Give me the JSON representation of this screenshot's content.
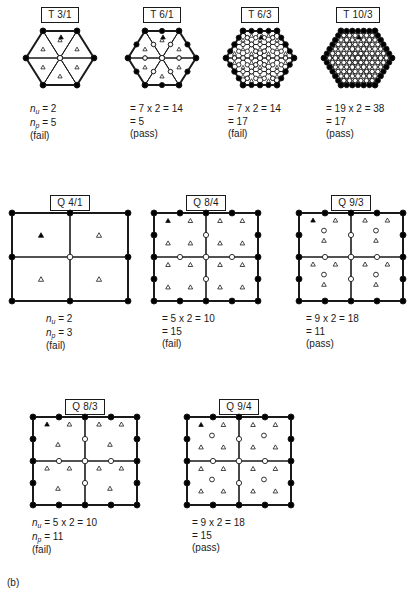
{
  "figure": {
    "panel_tag": "(b)",
    "background": "#ffffff",
    "ink": "#1a1a1a",
    "node_fill_boundary": "#000000",
    "node_fill_interior": "#ffffff",
    "marker_unknown_filled": "#000000",
    "marker_unknown_open": "#ffffff"
  },
  "patches": [
    {
      "id": "t31",
      "label": "T 3/1",
      "kind": "triangle-hex",
      "x": 6,
      "y": 4,
      "w": 108,
      "mesh_w": 108,
      "mesh_h": 78,
      "divisions": 1,
      "caption_lines": [
        {
          "prefix": "n",
          "sub": "u",
          "text": " = 2"
        },
        {
          "prefix": "n",
          "sub": "p",
          "text": " = 5"
        },
        {
          "text": "(fail)"
        }
      ],
      "caption_x": 24,
      "result": "fail"
    },
    {
      "id": "t61",
      "label": "T 6/1",
      "kind": "triangle-hex",
      "x": 110,
      "y": 4,
      "w": 104,
      "mesh_w": 104,
      "mesh_h": 78,
      "divisions": 1,
      "midside": true,
      "caption_lines": [
        {
          "text": "= 7 x 2 = 14"
        },
        {
          "text": "= 5"
        },
        {
          "text": "(pass)"
        }
      ],
      "caption_x": 20,
      "result": "pass"
    },
    {
      "id": "t63",
      "label": "T 6/3",
      "kind": "triangle-hex",
      "x": 208,
      "y": 4,
      "w": 104,
      "mesh_w": 104,
      "mesh_h": 78,
      "divisions": 2,
      "midside": true,
      "caption_lines": [
        {
          "text": "= 7 x 2 = 14"
        },
        {
          "text": "= 17"
        },
        {
          "text": "(fail)"
        }
      ],
      "caption_x": 20,
      "result": "fail"
    },
    {
      "id": "t103",
      "label": "T 10/3",
      "kind": "triangle-hex",
      "x": 304,
      "y": 4,
      "w": 108,
      "mesh_w": 108,
      "mesh_h": 78,
      "divisions": 3,
      "midside": true,
      "bubbles": true,
      "caption_lines": [
        {
          "text": "= 19 x 2 = 38"
        },
        {
          "text": "= 17"
        },
        {
          "text": "(pass)"
        }
      ],
      "caption_x": 22,
      "result": "pass"
    },
    {
      "id": "q41",
      "label": "Q 4/1",
      "kind": "quad-grid",
      "x": 6,
      "y": 192,
      "w": 128,
      "mesh_w": 128,
      "mesh_h": 100,
      "cell_tri": 1,
      "midside": false,
      "bubbles": false,
      "caption_lines": [
        {
          "prefix": "n",
          "sub": "u",
          "text": " = 2"
        },
        {
          "prefix": "n",
          "sub": "p",
          "text": " = 3"
        },
        {
          "text": "(fail)"
        }
      ],
      "caption_x": 40,
      "result": "fail"
    },
    {
      "id": "q84",
      "label": "Q 8/4",
      "kind": "quad-grid",
      "x": 148,
      "y": 192,
      "w": 116,
      "mesh_w": 116,
      "mesh_h": 100,
      "cell_tri": 4,
      "midside": true,
      "bubbles": false,
      "caption_lines": [
        {
          "text": "= 5 x 2 = 10"
        },
        {
          "text": "= 15"
        },
        {
          "text": "(fail)"
        }
      ],
      "caption_x": 14,
      "result": "fail"
    },
    {
      "id": "q93",
      "label": "Q 9/3",
      "kind": "quad-grid",
      "x": 290,
      "y": 192,
      "w": 122,
      "mesh_w": 116,
      "mesh_h": 100,
      "cell_tri": 3,
      "midside": true,
      "bubbles": true,
      "caption_lines": [
        {
          "text": "= 9 x 2 = 18"
        },
        {
          "text": "= 11"
        },
        {
          "text": "(pass)"
        }
      ],
      "caption_x": 16,
      "result": "pass"
    },
    {
      "id": "q83",
      "label": "Q 8/3",
      "kind": "quad-grid",
      "x": 20,
      "y": 396,
      "w": 130,
      "mesh_w": 116,
      "mesh_h": 100,
      "cell_tri": 3,
      "midside": true,
      "bubbles": false,
      "caption_lines": [
        {
          "prefix": "n",
          "sub": "u",
          "text": " = 5 x 2 = 10"
        },
        {
          "prefix": "n",
          "sub": "p",
          "text": " = 11"
        },
        {
          "text": "(fail)"
        }
      ],
      "caption_x": 12,
      "result": "fail"
    },
    {
      "id": "q94",
      "label": "Q 9/4",
      "kind": "quad-grid",
      "x": 176,
      "y": 396,
      "w": 126,
      "mesh_w": 116,
      "mesh_h": 100,
      "cell_tri": 4,
      "midside": true,
      "bubbles": true,
      "caption_lines": [
        {
          "text": "= 9 x 2 = 18"
        },
        {
          "text": "= 15"
        },
        {
          "text": "(pass)"
        }
      ],
      "caption_x": 16,
      "result": "pass"
    }
  ]
}
